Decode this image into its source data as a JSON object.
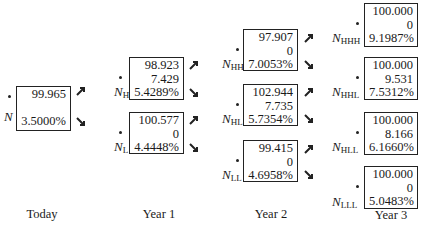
{
  "diagram": {
    "type": "binomial-interest-rate-tree",
    "time_labels": [
      "Today",
      "Year 1",
      "Year 2",
      "Year 3"
    ],
    "nodes": {
      "N": {
        "label": "N",
        "sub": "",
        "values": [
          "99.965",
          "3.5000%"
        ]
      },
      "NH": {
        "label": "N",
        "sub": "H",
        "values": [
          "98.923",
          "7.429",
          "5.4289%"
        ]
      },
      "NL": {
        "label": "N",
        "sub": "L",
        "values": [
          "100.577",
          "0",
          "4.4448%"
        ]
      },
      "NHH": {
        "label": "N",
        "sub": "HH",
        "values": [
          "97.907",
          "0",
          "7.0053%"
        ]
      },
      "NHL": {
        "label": "N",
        "sub": "HL",
        "values": [
          "102.944",
          "7.735",
          "5.7354%"
        ]
      },
      "NLL": {
        "label": "N",
        "sub": "LL",
        "values": [
          "99.415",
          "0",
          "4.6958%"
        ]
      },
      "NHHH": {
        "label": "N",
        "sub": "HHH",
        "values": [
          "100.000",
          "0",
          "9.1987%"
        ]
      },
      "NHHL": {
        "label": "N",
        "sub": "HHL",
        "values": [
          "100.000",
          "9.531",
          "7.5312%"
        ]
      },
      "NHLL": {
        "label": "N",
        "sub": "HLL",
        "values": [
          "100.000",
          "8.166",
          "6.1660%"
        ]
      },
      "NLLL": {
        "label": "N",
        "sub": "LLL",
        "values": [
          "100.000",
          "0",
          "5.0483%"
        ]
      }
    },
    "arrow_icons": {
      "up": "arrow-up-right-icon",
      "down": "arrow-down-right-icon"
    },
    "colors": {
      "ink": "#222222",
      "background": "#ffffff"
    }
  }
}
